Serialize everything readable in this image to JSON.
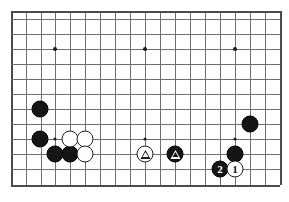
{
  "diagram": {
    "kind": "go-board-diagram",
    "board": {
      "columns": 19,
      "rows_shown": 12,
      "cell_size_px": 15,
      "origin": {
        "x": 11,
        "y": 11
      },
      "line_color": "#6e6e72",
      "edge_color": "#4a4a4f",
      "background_color": "#ffffff"
    },
    "colors": {
      "black_stone": "#151515",
      "white_stone": "#ffffff",
      "white_stone_border": "#202020",
      "marker_black": "#151515",
      "marker_white": "#ffffff",
      "hoshi": "#1a1a1a"
    },
    "vertical_lines": [
      11,
      26,
      41,
      55,
      70,
      85,
      100,
      115,
      130,
      145,
      160,
      175,
      190,
      205,
      220,
      235,
      250,
      265,
      280
    ],
    "horizontal_lines": [
      11,
      19,
      34,
      49,
      64,
      79,
      94,
      109,
      124,
      139,
      154,
      169,
      185
    ],
    "hoshi_points": [
      {
        "name": "star-point-upper-left",
        "x": 55,
        "y": 49,
        "size": "large"
      },
      {
        "name": "star-point-upper-center",
        "x": 145,
        "y": 49,
        "size": "large"
      },
      {
        "name": "star-point-upper-right",
        "x": 235,
        "y": 49,
        "size": "large"
      },
      {
        "name": "star-point-left-side",
        "x": 55,
        "y": 139,
        "size": "small"
      },
      {
        "name": "star-point-center",
        "x": 145,
        "y": 139,
        "size": "small"
      },
      {
        "name": "star-point-right-side",
        "x": 235,
        "y": 139,
        "size": "small"
      }
    ],
    "stones": [
      {
        "id": "black-upper-left-corner",
        "color": "black",
        "x": 40,
        "y": 109,
        "marker": "none",
        "label": ""
      },
      {
        "id": "black-left-side-upper",
        "color": "black",
        "x": 40,
        "y": 139,
        "marker": "none",
        "label": ""
      },
      {
        "id": "black-left-lower-a",
        "color": "black",
        "x": 55,
        "y": 154,
        "marker": "none",
        "label": ""
      },
      {
        "id": "black-left-lower-b",
        "color": "black",
        "x": 70,
        "y": 154,
        "marker": "none",
        "label": ""
      },
      {
        "id": "white-left-group-a",
        "color": "white",
        "x": 70,
        "y": 139,
        "marker": "none",
        "label": ""
      },
      {
        "id": "white-left-group-b",
        "color": "white",
        "x": 85,
        "y": 139,
        "marker": "none",
        "label": ""
      },
      {
        "id": "white-left-group-c",
        "color": "white",
        "x": 85,
        "y": 154,
        "marker": "none",
        "label": ""
      },
      {
        "id": "white-triangle-center",
        "color": "white",
        "x": 145,
        "y": 154,
        "marker": "triangle",
        "label": ""
      },
      {
        "id": "black-triangle-center",
        "color": "black",
        "x": 175,
        "y": 154,
        "marker": "triangle",
        "label": ""
      },
      {
        "id": "black-right-corner-upper",
        "color": "black",
        "x": 250,
        "y": 124,
        "marker": "none",
        "label": ""
      },
      {
        "id": "black-right-side",
        "color": "black",
        "x": 235,
        "y": 154,
        "marker": "none",
        "label": ""
      },
      {
        "id": "black-move-2",
        "color": "black",
        "x": 220,
        "y": 169,
        "marker": "number",
        "label": "2"
      },
      {
        "id": "white-move-1",
        "color": "white",
        "x": 235,
        "y": 169,
        "marker": "number",
        "label": "1"
      }
    ]
  }
}
